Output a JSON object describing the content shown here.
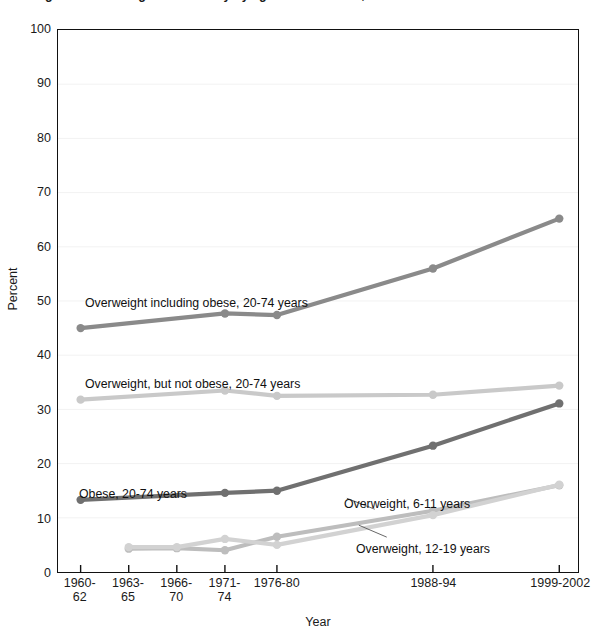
{
  "chart_data": {
    "type": "line",
    "title": "Figure 1. Overweight and obesity by age: United States, 1960-2002",
    "xlabel": "Year",
    "ylabel": "Percent",
    "ylim": [
      0,
      100
    ],
    "ytick_step": 10,
    "yticks": [
      "0",
      "10",
      "20",
      "30",
      "40",
      "50",
      "60",
      "70",
      "80",
      "90",
      "100"
    ],
    "grid": true,
    "legend_position": "inline-annotations",
    "categories": [
      "1960-62",
      "1963-65",
      "1966-70",
      "1971-74",
      "1976-80",
      "1988-94",
      "1999-2002"
    ],
    "category_lines": [
      {
        "line1": "1960-",
        "line2": "62"
      },
      {
        "line1": "1963-",
        "line2": "65"
      },
      {
        "line1": "1966-",
        "line2": "70"
      },
      {
        "line1": "1971-",
        "line2": "74"
      },
      {
        "line1": "1976-80",
        "line2": ""
      },
      {
        "line1": "1988-94",
        "line2": ""
      },
      {
        "line1": "1999-2002",
        "line2": ""
      }
    ],
    "series": [
      {
        "name": "Overweight including obese, 20-74 years",
        "color": "#8a8a8a",
        "values": [
          45.0,
          null,
          null,
          47.7,
          47.4,
          56.0,
          65.2
        ]
      },
      {
        "name": "Overweight, but not obese, 20-74 years",
        "color": "#c9c9c9",
        "values": [
          31.8,
          null,
          null,
          33.5,
          32.5,
          32.7,
          34.4
        ]
      },
      {
        "name": "Obese, 20-74 years",
        "color": "#707070",
        "values": [
          13.3,
          null,
          null,
          14.6,
          15.0,
          23.3,
          31.1
        ]
      },
      {
        "name": "Overweight, 6-11 years",
        "color": "#bdbdbd",
        "values": [
          null,
          4.3,
          4.4,
          4.0,
          6.5,
          11.3,
          16.0
        ]
      },
      {
        "name": "Overweight, 12-19 years",
        "color": "#d2d2d2",
        "values": [
          null,
          4.6,
          4.6,
          6.1,
          5.0,
          10.5,
          16.1
        ]
      }
    ],
    "annotations": [
      {
        "text": "Overweight including obese, 20-74 years",
        "x_px": 84,
        "y_px": 296
      },
      {
        "text": "Overweight, but not obese, 20-74 years",
        "x_px": 84,
        "y_px": 377
      },
      {
        "text": "Obese, 20-74 years",
        "x_px": 78,
        "y_px": 487
      },
      {
        "text": "Overweight, 6-11 years",
        "x_px": 343,
        "y_px": 497
      },
      {
        "text": "Overweight, 12-19 years",
        "x_px": 355,
        "y_px": 542
      }
    ]
  }
}
